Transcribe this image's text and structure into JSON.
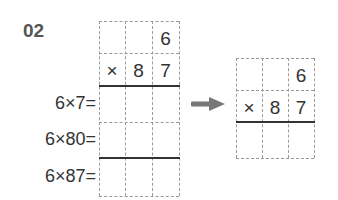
{
  "problem": {
    "number": "02",
    "left_grid": {
      "rows": [
        [
          "",
          "",
          "6"
        ],
        [
          "×",
          "8",
          "7"
        ],
        [
          "",
          "",
          ""
        ],
        [
          "",
          "",
          ""
        ],
        [
          "",
          "",
          ""
        ]
      ]
    },
    "equations": [
      "6×7=",
      "6×80=",
      "6×87="
    ],
    "right_grid": {
      "rows": [
        [
          "",
          "",
          "6"
        ],
        [
          "×",
          "8",
          "7"
        ],
        [
          "",
          "",
          ""
        ]
      ]
    },
    "arrow_icon": "right-arrow-icon",
    "colors": {
      "text": "#333333",
      "number": "#555555",
      "dashed_line": "#9a9a9a",
      "arrow": "#777777"
    }
  }
}
